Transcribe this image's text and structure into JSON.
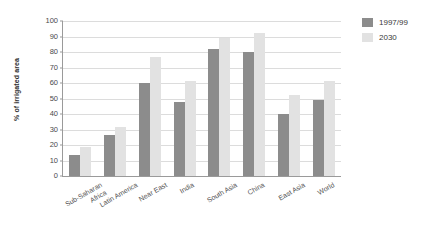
{
  "chart": {
    "ylabel": "% of irrigated area",
    "legend_position": "top-right"
  },
  "chart_data": {
    "type": "bar",
    "title": "",
    "xlabel": "",
    "ylabel": "% of irrigated area",
    "ylim": [
      0,
      100
    ],
    "ytick_step": 10,
    "yticks": [
      100,
      90,
      80,
      70,
      60,
      50,
      40,
      30,
      20,
      10,
      0
    ],
    "grid": true,
    "legend": [
      "1997/99",
      "2030"
    ],
    "colors": [
      "#8c8c8c",
      "#e2e2e2"
    ],
    "categories": [
      "Sub-Saharan Africa",
      "Latin America",
      "Near East",
      "India",
      "South Asia",
      "China",
      "East Asia",
      "World"
    ],
    "category_lines": [
      [
        "Sub-Saharan",
        "Africa"
      ],
      [
        "Latin America"
      ],
      [
        "Near East"
      ],
      [
        "India"
      ],
      [
        "South Asia"
      ],
      [
        "China"
      ],
      [
        "East Asia"
      ],
      [
        "World"
      ]
    ],
    "series": [
      {
        "name": "1997/99",
        "color": "#8c8c8c",
        "values": [
          13.5,
          26.5,
          60,
          48,
          82,
          80,
          40,
          49
        ]
      },
      {
        "name": "2030",
        "color": "#e2e2e2",
        "values": [
          19,
          31.5,
          76.5,
          61,
          89,
          92,
          52,
          61
        ]
      }
    ]
  }
}
